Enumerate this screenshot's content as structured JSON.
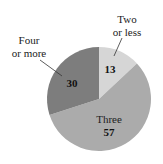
{
  "chart_data": {
    "type": "pie",
    "title": "",
    "categories": [
      "Two or less",
      "Three",
      "Four or more"
    ],
    "values": [
      13,
      57,
      30
    ],
    "colors": [
      "#d6d6d6",
      "#ababab",
      "#7d7d7d"
    ],
    "start_angle_deg": 0,
    "direction": "clockwise",
    "legend": "none",
    "labels": {
      "two_or_less": {
        "line1": "Two",
        "line2": "or less",
        "value": "13"
      },
      "three": {
        "line1": "Three",
        "value": "57"
      },
      "four_or_more": {
        "line1": "Four",
        "line2": "or more",
        "value": "30"
      }
    }
  }
}
